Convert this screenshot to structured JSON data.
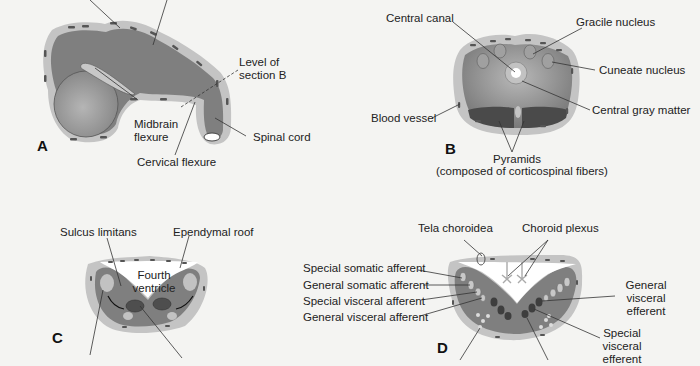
{
  "colors": {
    "background": "#f4f4f2",
    "tissue_dark": "#7d7d7d",
    "tissue_mid": "#9a9a9a",
    "pia_outer": "#c4c4c4",
    "vessel": "#5a5a5a",
    "ventricle": "#ffffff",
    "nucleus_light": "#c9c9c9",
    "nucleus_dark": "#4e4e4e",
    "leader_line": "#333333"
  },
  "panels": {
    "A": {
      "letter": "A",
      "labels": {
        "level_of_section": "Level of section B",
        "midbrain_flexure": "Midbrain flexure",
        "spinal_cord": "Spinal cord",
        "cervical_flexure": "Cervical flexure"
      }
    },
    "B": {
      "letter": "B",
      "labels": {
        "central_canal": "Central canal",
        "gracile_nucleus": "Gracile nucleus",
        "cuneate_nucleus": "Cuneate nucleus",
        "central_gray_matter": "Central gray matter",
        "blood_vessel": "Blood vessel",
        "pyramids": "Pyramids",
        "pyramids_note": "(composed of corticospinal fibers)"
      }
    },
    "C": {
      "letter": "C",
      "labels": {
        "sulcus_limitans": "Sulcus limitans",
        "ependymal_roof": "Ependymal roof",
        "fourth_ventricle": "Fourth ventricle"
      }
    },
    "D": {
      "letter": "D",
      "labels": {
        "tela_choroidea": "Tela choroidea",
        "choroid_plexus": "Choroid plexus",
        "special_somatic_afferent": "Special somatic afferent",
        "general_somatic_afferent": "General somatic afferent",
        "special_visceral_afferent": "Special visceral afferent",
        "general_visceral_afferent": "General visceral afferent",
        "general_visceral_efferent": "General visceral efferent",
        "special_visceral_efferent": "Special visceral efferent"
      }
    }
  }
}
